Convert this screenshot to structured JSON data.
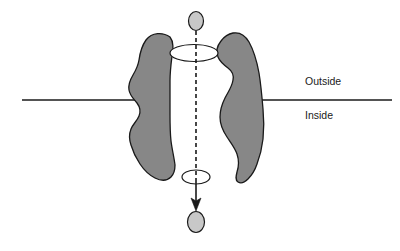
{
  "figure": {
    "type": "biological-schematic",
    "background_color": "#ffffff"
  },
  "colors": {
    "protein_fill": "#878787",
    "protein_stroke": "#1a1a1a",
    "particle_fill": "#c8c8c8",
    "particle_stroke": "#1a1a1a",
    "membrane_line": "#1a1a1a",
    "pathway_line": "#1a1a1a",
    "pore_opening_fill": "#ffffff",
    "label_color": "#1a1a1a"
  },
  "labels": {
    "outside": "Outside",
    "inside": "Inside"
  },
  "membrane": {
    "left_segment": {
      "x1": 22,
      "y1": 100,
      "x2": 147,
      "y2": 100
    },
    "right_segment": {
      "x1": 258,
      "y1": 100,
      "x2": 392,
      "y2": 100
    },
    "stroke_width": 1.4
  },
  "label_positions": {
    "outside": {
      "x": 305,
      "y": 85
    },
    "inside": {
      "x": 305,
      "y": 119
    }
  },
  "particles": [
    {
      "name": "substrate-particle-outside",
      "cx": 196,
      "cy": 21,
      "rx": 7.5,
      "ry": 9.5
    },
    {
      "name": "substrate-particle-inside",
      "cx": 196,
      "cy": 222,
      "rx": 8.5,
      "ry": 10.5
    }
  ],
  "pore_openings": [
    {
      "name": "pore-opening-top",
      "cx": 194,
      "cy": 53,
      "rx": 24,
      "ry": 8.5
    },
    {
      "name": "pore-opening-bottom",
      "cx": 196,
      "cy": 177,
      "rx": 14,
      "ry": 7
    }
  ],
  "transport_path": {
    "dashed_segment": {
      "x1": 196,
      "y1": 31,
      "x2": 196,
      "y2": 178
    },
    "dash_pattern": "4,3",
    "solid_segment": {
      "x1": 196,
      "y1": 178,
      "x2": 196,
      "y2": 207
    },
    "arrow_tip_y": 210,
    "arrow_half_width": 5,
    "stroke_width": 1.6
  },
  "protein_subunits": [
    {
      "name": "protein-subunit-left",
      "path": "M 170 37 C 163 32 152 32 146 40 C 141 47 140 53 139 60 C 138 66 136 70 133 75 C 130 80 128 84 129 90 C 130 96 134 99 137 103 C 140 107 141 111 139 116 C 137 121 133 124 131 129 C 129 134 129 139 131 145 C 133 152 136 158 140 164 C 144 170 149 175 155 178 C 161 181 167 181 171 177 C 174 174 175 170 175 165 C 174 157 172 149 171 141 C 170 132 170 123 170 114 C 170 103 170 92 170 81 C 170 72 171 64 172 56 C 173 49 174 42 170 37 Z"
    },
    {
      "name": "protein-subunit-right",
      "path": "M 221 41 C 217 46 216 52 218 57 C 220 62 224 65 228 68 C 232 71 234 75 233 80 C 232 87 228 92 225 98 C 222 104 220 110 220 117 C 220 125 223 131 227 137 C 231 143 235 148 237 154 C 239 160 239 166 237 172 C 236 176 235 180 238 182 C 241 184 245 182 248 179 C 252 175 255 170 257 164 C 260 156 262 148 263 139 C 264 129 264 119 263 109 C 262 97 261 85 259 73 C 257 62 254 51 249 42 C 245 35 239 32 233 33 C 227 34 224 37 221 41 Z"
    }
  ]
}
